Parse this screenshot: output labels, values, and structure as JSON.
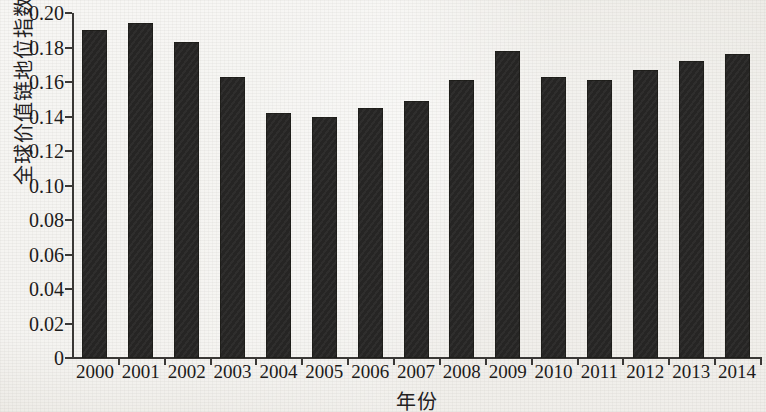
{
  "chart_data": {
    "type": "bar",
    "title": "",
    "xlabel": "年份",
    "ylabel": "全球价值链地位指数",
    "categories": [
      "2000",
      "2001",
      "2002",
      "2003",
      "2004",
      "2005",
      "2006",
      "2007",
      "2008",
      "2009",
      "2010",
      "2011",
      "2012",
      "2013",
      "2014"
    ],
    "values": [
      0.19,
      0.194,
      0.183,
      0.163,
      0.142,
      0.14,
      0.145,
      0.149,
      0.161,
      0.178,
      0.163,
      0.161,
      0.167,
      0.172,
      0.176
    ],
    "series": [
      {
        "name": "全球价值链地位指数",
        "values": [
          0.19,
          0.194,
          0.183,
          0.163,
          0.142,
          0.14,
          0.145,
          0.149,
          0.161,
          0.178,
          0.163,
          0.161,
          0.167,
          0.172,
          0.176
        ]
      }
    ],
    "ylim": [
      0,
      0.2
    ],
    "ytick_labels": [
      "0",
      "0.02",
      "0.04",
      "0.06",
      "0.08",
      "0.10",
      "0.12",
      "0.14",
      "0.16",
      "0.18",
      "0.20"
    ],
    "ytick_values": [
      0,
      0.02,
      0.04,
      0.06,
      0.08,
      0.1,
      0.12,
      0.14,
      0.16,
      0.18,
      0.2
    ],
    "grid": false,
    "legend": null,
    "bar_color": "#262524",
    "axis_color": "#3a3836",
    "background_color": "#eceae5"
  }
}
